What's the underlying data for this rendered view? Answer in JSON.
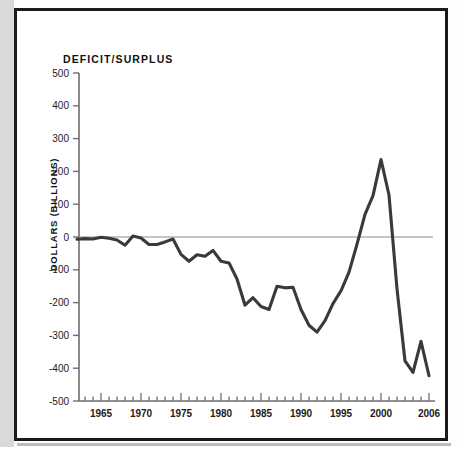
{
  "figure": {
    "title": "DEFICIT/SURPLUS",
    "y_axis_label": "DOLLARS (BILLIONS)",
    "line_color": "#3a3a3a",
    "zero_line_color": "#8c8c8c",
    "axis_color": "#6e6e6e",
    "frame_color": "#1a1a1a"
  },
  "chart_data": {
    "type": "line",
    "title": "DEFICIT/SURPLUS",
    "xlabel": "",
    "ylabel": "DOLLARS (BILLIONS)",
    "xlim": [
      1962,
      2006
    ],
    "ylim": [
      -500,
      500
    ],
    "ytick_labels": [
      "500",
      "400",
      "300",
      "200",
      "100",
      "0",
      "-100",
      "-200",
      "-300",
      "-400",
      "-500"
    ],
    "yticks": [
      500,
      400,
      300,
      200,
      100,
      0,
      -100,
      -200,
      -300,
      -400,
      -500
    ],
    "xtick_labels": [
      "1965",
      "1970",
      "1975",
      "1980",
      "1985",
      "1990",
      "1995",
      "2000",
      "2006"
    ],
    "xticks_labeled": [
      1965,
      1970,
      1975,
      1980,
      1985,
      1990,
      1995,
      2000,
      2006
    ],
    "xticks_minor_step": 1,
    "grid": false,
    "legend": "none",
    "zero_reference_line": 0,
    "x": [
      1962,
      1963,
      1964,
      1965,
      1966,
      1967,
      1968,
      1969,
      1970,
      1971,
      1972,
      1973,
      1974,
      1975,
      1976,
      1977,
      1978,
      1979,
      1980,
      1981,
      1982,
      1983,
      1984,
      1985,
      1986,
      1987,
      1988,
      1989,
      1990,
      1991,
      1992,
      1993,
      1994,
      1995,
      1996,
      1997,
      1998,
      1999,
      2000,
      2001,
      2002,
      2003,
      2004,
      2005,
      2006
    ],
    "values": [
      -7,
      -5,
      -6,
      -1,
      -4,
      -9,
      -25,
      3,
      -3,
      -23,
      -23,
      -15,
      -6,
      -53,
      -74,
      -54,
      -59,
      -41,
      -74,
      -79,
      -128,
      -208,
      -185,
      -212,
      -221,
      -150,
      -155,
      -153,
      -221,
      -269,
      -290,
      -255,
      -203,
      -164,
      -107,
      -22,
      69,
      126,
      236,
      128,
      -158,
      -378,
      -413,
      -318,
      -423
    ],
    "series": [
      {
        "name": "Federal deficit/surplus",
        "values": [
          -7,
          -5,
          -6,
          -1,
          -4,
          -9,
          -25,
          3,
          -3,
          -23,
          -23,
          -15,
          -6,
          -53,
          -74,
          -54,
          -59,
          -41,
          -74,
          -79,
          -128,
          -208,
          -185,
          -212,
          -221,
          -150,
          -155,
          -153,
          -221,
          -269,
          -290,
          -255,
          -203,
          -164,
          -107,
          -22,
          69,
          126,
          236,
          128,
          -158,
          -378,
          -413,
          -318,
          -423
        ]
      }
    ]
  }
}
